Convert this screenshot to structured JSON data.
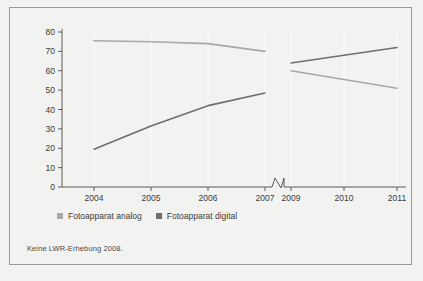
{
  "figure": {
    "background_color": "#f2f2f0",
    "frame_color": "#9a9a9a",
    "footnote": "Keine LWR-Erhebung 2008."
  },
  "legend": {
    "entries": [
      {
        "label": "Fotoapparat analog",
        "color": "#a8a8a8",
        "marker": "square-marker"
      },
      {
        "label": "Fotoapparat digital",
        "color": "#6e6e6e",
        "marker": "square-marker"
      }
    ]
  },
  "axis_break": {
    "name": "x-axis-break-marker",
    "between": [
      "2007",
      "2009"
    ]
  },
  "chart_data": {
    "type": "line",
    "title": "",
    "subtitle": "",
    "xlabel": "",
    "ylabel": "",
    "grid": false,
    "legend_position": "bottom-left",
    "categories": [
      "2004",
      "2005",
      "2006",
      "2007",
      "2009",
      "2010",
      "2011"
    ],
    "xtick_labels": [
      "2004",
      "2005",
      "2006",
      "2007",
      "2009",
      "2010",
      "2011"
    ],
    "ytick_labels": [
      "0",
      "10",
      "20",
      "30",
      "40",
      "50",
      "60",
      "70",
      "80"
    ],
    "ylim": [
      0,
      80
    ],
    "ytick_step": 10,
    "x_axis_break_after": "2007",
    "annotations": [
      "Keine LWR-Erhebung 2008."
    ],
    "series": [
      {
        "name": "Fotoapparat analog",
        "color": "#a8a8a8",
        "values": [
          75.5,
          75.0,
          74.0,
          70.0,
          60.0,
          55.5,
          51.0
        ]
      },
      {
        "name": "Fotoapparat digital",
        "color": "#6e6e6e",
        "values": [
          19.5,
          31.5,
          42.0,
          48.5,
          64.0,
          68.0,
          72.0
        ]
      }
    ]
  }
}
